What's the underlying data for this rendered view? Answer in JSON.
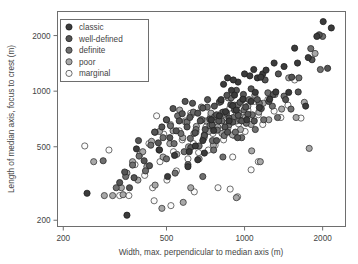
{
  "figure": {
    "background": "#ffffff",
    "frame_color": "#6e6e6e",
    "text_color": "#444444"
  },
  "chart_data": {
    "type": "scatter",
    "title": "",
    "xlabel": "Width, max. perpendicular to median axis (m)",
    "ylabel": "Length of median axis, focus to crest (m)",
    "xscale": "log",
    "yscale": "log",
    "xlim": [
      190,
      2450
    ],
    "ylim": [
      185,
      2700
    ],
    "xticks": [
      200,
      500,
      1000,
      2000
    ],
    "xticklabels": [
      "200",
      "500",
      "1000",
      "2000"
    ],
    "yticks": [
      200,
      500,
      1000,
      2000
    ],
    "yticklabels": [
      "200",
      "500",
      "1000",
      "2000"
    ],
    "grid": false,
    "legend_position": "upper left",
    "legend_title": "",
    "series": [
      {
        "name": "classic",
        "color": "#3b3b3b",
        "edge": "#1f1f1f",
        "points": [
          [
            247,
            280
          ],
          [
            352,
            213
          ],
          [
            383,
            487
          ],
          [
            470,
            481
          ],
          [
            537,
            449
          ],
          [
            612,
            470
          ],
          [
            646,
            505
          ],
          [
            690,
            540
          ],
          [
            700,
            462
          ],
          [
            745,
            700
          ],
          [
            760,
            612
          ],
          [
            800,
            735
          ],
          [
            812,
            900
          ],
          [
            845,
            775
          ],
          [
            860,
            1180
          ],
          [
            872,
            690
          ],
          [
            890,
            1010
          ],
          [
            900,
            835
          ],
          [
            915,
            952
          ],
          [
            930,
            790
          ],
          [
            944,
            1120
          ],
          [
            985,
            905
          ],
          [
            1000,
            1240
          ],
          [
            1020,
            700
          ],
          [
            1048,
            1210
          ],
          [
            1060,
            880
          ],
          [
            1085,
            1310
          ],
          [
            1100,
            985
          ],
          [
            1120,
            1180
          ],
          [
            1140,
            815
          ],
          [
            1175,
            1240
          ],
          [
            1210,
            1300
          ],
          [
            1250,
            905
          ],
          [
            1300,
            1420
          ],
          [
            1320,
            990
          ],
          [
            1420,
            1360
          ],
          [
            1480,
            985
          ],
          [
            1560,
            1710
          ],
          [
            1600,
            1420
          ],
          [
            1720,
            830
          ],
          [
            1760,
            1520
          ],
          [
            1900,
            1980
          ],
          [
            2010,
            2380
          ],
          [
            2160,
            2200
          ],
          [
            830,
            1090
          ],
          [
            1155,
            1190
          ],
          [
            905,
            1150
          ],
          [
            660,
            425
          ],
          [
            605,
            390
          ],
          [
            505,
            345
          ]
        ]
      },
      {
        "name": "well-defined",
        "color": "#555555",
        "edge": "#252525",
        "points": [
          [
            330,
            320
          ],
          [
            345,
            365
          ],
          [
            360,
            300
          ],
          [
            375,
            340
          ],
          [
            390,
            540
          ],
          [
            410,
            420
          ],
          [
            430,
            395
          ],
          [
            450,
            600
          ],
          [
            465,
            525
          ],
          [
            480,
            640
          ],
          [
            500,
            700
          ],
          [
            515,
            560
          ],
          [
            530,
            805
          ],
          [
            545,
            610
          ],
          [
            560,
            690
          ],
          [
            575,
            755
          ],
          [
            590,
            880
          ],
          [
            600,
            640
          ],
          [
            615,
            720
          ],
          [
            630,
            860
          ],
          [
            645,
            595
          ],
          [
            660,
            760
          ],
          [
            675,
            690
          ],
          [
            690,
            810
          ],
          [
            705,
            620
          ],
          [
            720,
            900
          ],
          [
            735,
            705
          ],
          [
            750,
            655
          ],
          [
            765,
            830
          ],
          [
            780,
            745
          ],
          [
            795,
            690
          ],
          [
            810,
            880
          ],
          [
            825,
            770
          ],
          [
            840,
            640
          ],
          [
            855,
            950
          ],
          [
            870,
            715
          ],
          [
            885,
            845
          ],
          [
            900,
            680
          ],
          [
            915,
            790
          ],
          [
            930,
            1010
          ],
          [
            945,
            740
          ],
          [
            960,
            870
          ],
          [
            975,
            690
          ],
          [
            990,
            960
          ],
          [
            1010,
            820
          ],
          [
            1030,
            750
          ],
          [
            1060,
            1030
          ],
          [
            1090,
            690
          ],
          [
            1120,
            900
          ],
          [
            1160,
            805
          ],
          [
            1200,
            1150
          ],
          [
            1240,
            880
          ],
          [
            1290,
            960
          ],
          [
            1350,
            1240
          ],
          [
            1440,
            900
          ],
          [
            1520,
            1190
          ],
          [
            1610,
            990
          ],
          [
            1820,
            1480
          ],
          [
            1940,
            2020
          ],
          [
            2090,
            1330
          ],
          [
            620,
            495
          ],
          [
            700,
            575
          ],
          [
            780,
            540
          ],
          [
            860,
            600
          ],
          [
            940,
            560
          ]
        ]
      },
      {
        "name": "definite",
        "color": "#6f6f6f",
        "edge": "#2b2b2b",
        "points": [
          [
            285,
            420
          ],
          [
            320,
            300
          ],
          [
            348,
            345
          ],
          [
            370,
            398
          ],
          [
            392,
            445
          ],
          [
            415,
            370
          ],
          [
            435,
            510
          ],
          [
            452,
            600
          ],
          [
            468,
            480
          ],
          [
            485,
            560
          ],
          [
            500,
            430
          ],
          [
            518,
            650
          ],
          [
            535,
            520
          ],
          [
            552,
            735
          ],
          [
            568,
            590
          ],
          [
            585,
            470
          ],
          [
            600,
            680
          ],
          [
            618,
            555
          ],
          [
            635,
            770
          ],
          [
            650,
            620
          ],
          [
            668,
            505
          ],
          [
            685,
            700
          ],
          [
            700,
            580
          ],
          [
            718,
            820
          ],
          [
            735,
            650
          ],
          [
            752,
            540
          ],
          [
            768,
            730
          ],
          [
            785,
            615
          ],
          [
            800,
            870
          ],
          [
            818,
            690
          ],
          [
            835,
            575
          ],
          [
            852,
            760
          ],
          [
            870,
            655
          ],
          [
            888,
            920
          ],
          [
            905,
            720
          ],
          [
            922,
            600
          ],
          [
            940,
            840
          ],
          [
            958,
            700
          ],
          [
            975,
            560
          ],
          [
            995,
            790
          ],
          [
            1015,
            670
          ],
          [
            1040,
            900
          ],
          [
            1070,
            745
          ],
          [
            1100,
            620
          ],
          [
            1140,
            860
          ],
          [
            1185,
            700
          ],
          [
            1230,
            980
          ],
          [
            1280,
            830
          ],
          [
            1340,
            720
          ],
          [
            1420,
            940
          ],
          [
            1510,
            800
          ],
          [
            1620,
            1180
          ],
          [
            1800,
            1700
          ],
          [
            1960,
            1310
          ],
          [
            2000,
            1980
          ],
          [
            540,
            360
          ],
          [
            605,
            400
          ],
          [
            690,
            345
          ],
          [
            760,
            480
          ],
          [
            825,
            440
          ]
        ]
      },
      {
        "name": "poor",
        "color": "#a8a8a8",
        "edge": "#3a3a3a",
        "points": [
          [
            262,
            415
          ],
          [
            288,
            272
          ],
          [
            310,
            272
          ],
          [
            335,
            300
          ],
          [
            352,
            360
          ],
          [
            370,
            415
          ],
          [
            388,
            330
          ],
          [
            405,
            470
          ],
          [
            420,
            390
          ],
          [
            438,
            535
          ],
          [
            452,
            310
          ],
          [
            470,
            605
          ],
          [
            485,
            440
          ],
          [
            500,
            700
          ],
          [
            515,
            520
          ],
          [
            530,
            610
          ],
          [
            548,
            455
          ],
          [
            562,
            790
          ],
          [
            578,
            560
          ],
          [
            592,
            680
          ],
          [
            608,
            500
          ],
          [
            622,
            740
          ],
          [
            638,
            590
          ],
          [
            652,
            645
          ],
          [
            668,
            430
          ],
          [
            682,
            820
          ],
          [
            698,
            560
          ],
          [
            712,
            690
          ],
          [
            728,
            605
          ],
          [
            742,
            760
          ],
          [
            758,
            510
          ],
          [
            772,
            700
          ],
          [
            788,
            640
          ],
          [
            802,
            880
          ],
          [
            818,
            590
          ],
          [
            835,
            750
          ],
          [
            850,
            670
          ],
          [
            865,
            920
          ],
          [
            882,
            705
          ],
          [
            898,
            580
          ],
          [
            915,
            840
          ],
          [
            932,
            690
          ],
          [
            948,
            760
          ],
          [
            965,
            620
          ],
          [
            985,
            900
          ],
          [
            1005,
            720
          ],
          [
            1030,
            830
          ],
          [
            1060,
            660
          ],
          [
            1095,
            950
          ],
          [
            1135,
            770
          ],
          [
            1180,
            860
          ],
          [
            1240,
            700
          ],
          [
            1310,
            960
          ],
          [
            1390,
            800
          ],
          [
            1480,
            1180
          ],
          [
            1580,
            720
          ],
          [
            1700,
            870
          ],
          [
            1870,
            1600
          ],
          [
            580,
            250
          ],
          [
            480,
            232
          ],
          [
            340,
            275
          ],
          [
            620,
            300
          ],
          [
            930,
            265
          ],
          [
            1065,
            475
          ],
          [
            1150,
            415
          ],
          [
            1775,
            490
          ]
        ]
      },
      {
        "name": "marginal",
        "color": "#fbfbfb",
        "edge": "#4a4a4a",
        "points": [
          [
            242,
            505
          ],
          [
            300,
            480
          ],
          [
            330,
            272
          ],
          [
            358,
            272
          ],
          [
            378,
            400
          ],
          [
            395,
            455
          ],
          [
            412,
            350
          ],
          [
            428,
            520
          ],
          [
            442,
            300
          ],
          [
            458,
            735
          ],
          [
            472,
            415
          ],
          [
            488,
            585
          ],
          [
            502,
            330
          ],
          [
            518,
            660
          ],
          [
            532,
            470
          ],
          [
            546,
            370
          ],
          [
            560,
            610
          ],
          [
            575,
            545
          ],
          [
            590,
            690
          ],
          [
            605,
            430
          ],
          [
            620,
            760
          ],
          [
            635,
            520
          ],
          [
            650,
            600
          ],
          [
            665,
            465
          ],
          [
            680,
            700
          ],
          [
            695,
            555
          ],
          [
            710,
            640
          ],
          [
            725,
            480
          ],
          [
            740,
            730
          ],
          [
            755,
            590
          ],
          [
            770,
            510
          ],
          [
            785,
            680
          ],
          [
            800,
            620
          ],
          [
            815,
            760
          ],
          [
            830,
            545
          ],
          [
            845,
            700
          ],
          [
            862,
            630
          ],
          [
            878,
            810
          ],
          [
            895,
            690
          ],
          [
            912,
            575
          ],
          [
            930,
            745
          ],
          [
            948,
            665
          ],
          [
            965,
            860
          ],
          [
            985,
            720
          ],
          [
            1005,
            605
          ],
          [
            1030,
            790
          ],
          [
            1058,
            690
          ],
          [
            1090,
            880
          ],
          [
            1130,
            745
          ],
          [
            1175,
            660
          ],
          [
            1230,
            900
          ],
          [
            1300,
            780
          ],
          [
            1380,
            720
          ],
          [
            1470,
            840
          ],
          [
            1560,
            1150
          ],
          [
            1650,
            715
          ],
          [
            880,
            295
          ],
          [
            790,
            300
          ],
          [
            900,
            440
          ],
          [
            1130,
            415
          ],
          [
            1060,
            375
          ],
          [
            940,
            268
          ],
          [
            520,
            240
          ],
          [
            448,
            255
          ],
          [
            640,
            285
          ]
        ]
      }
    ]
  },
  "legend": {
    "entries": [
      {
        "label": "classic"
      },
      {
        "label": "well-defined"
      },
      {
        "label": "definite"
      },
      {
        "label": "poor"
      },
      {
        "label": "marginal"
      }
    ]
  }
}
